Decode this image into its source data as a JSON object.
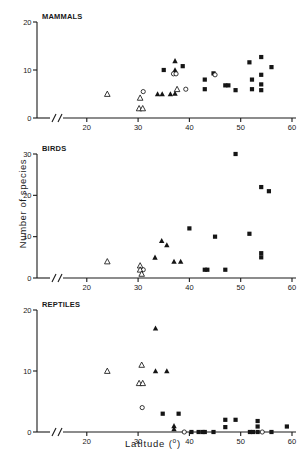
{
  "figure": {
    "xlabel_text": "Latitude (",
    "xlabel_unit": "o",
    "xlabel_close": ")",
    "ylabel": "Number of species"
  },
  "chart_data": [
    {
      "type": "scatter",
      "title": "MAMMALS",
      "xlabel": "Latitude (º)",
      "ylabel": "Number of species",
      "xlim": [
        14,
        60
      ],
      "ylim": [
        0,
        20
      ],
      "xticks": [
        20,
        30,
        40,
        50,
        60
      ],
      "yticks": [
        0,
        10,
        20
      ],
      "axis_break_x": true,
      "grid": false,
      "legend": "none",
      "series": [
        {
          "name": "filled-square",
          "marker": "filled-square",
          "points": [
            [
              35,
              10
            ],
            [
              38.7,
              10.8
            ],
            [
              43,
              8
            ],
            [
              43,
              6
            ],
            [
              44.7,
              9.3
            ],
            [
              47,
              6.8
            ],
            [
              47.6,
              6.8
            ],
            [
              49,
              5.8
            ],
            [
              51.7,
              11.6
            ],
            [
              52.2,
              8
            ],
            [
              52.2,
              6
            ],
            [
              54,
              12.7
            ],
            [
              54,
              9
            ],
            [
              54,
              7
            ],
            [
              54,
              5.8
            ],
            [
              56,
              10.6
            ]
          ]
        },
        {
          "name": "filled-triangle",
          "marker": "filled-triangle",
          "points": [
            [
              33.8,
              5
            ],
            [
              34.7,
              5
            ],
            [
              36.3,
              5
            ],
            [
              37.2,
              11.9
            ],
            [
              37.2,
              10
            ],
            [
              37.2,
              5.1
            ]
          ]
        },
        {
          "name": "open-circle",
          "marker": "open-circle",
          "points": [
            [
              31,
              5.5
            ],
            [
              36.9,
              9.2
            ],
            [
              37.4,
              9.2
            ],
            [
              39.3,
              6
            ],
            [
              45,
              9
            ]
          ]
        },
        {
          "name": "open-triangle",
          "marker": "open-triangle",
          "points": [
            [
              24,
              5
            ],
            [
              30.4,
              4.2
            ],
            [
              30.2,
              2
            ],
            [
              30.9,
              2
            ],
            [
              37.6,
              6
            ]
          ]
        }
      ]
    },
    {
      "type": "scatter",
      "title": "BIRDS",
      "xlabel": "Latitude (º)",
      "ylabel": "Number of species",
      "xlim": [
        14,
        60
      ],
      "ylim": [
        0,
        30
      ],
      "xticks": [
        20,
        30,
        40,
        50,
        60
      ],
      "yticks": [
        0,
        10,
        20,
        30
      ],
      "axis_break_x": true,
      "grid": false,
      "legend": "none",
      "series": [
        {
          "name": "filled-square",
          "marker": "filled-square",
          "points": [
            [
              40,
              12
            ],
            [
              43,
              2
            ],
            [
              43.5,
              2
            ],
            [
              47,
              2
            ],
            [
              49,
              30
            ],
            [
              51.7,
              10.7
            ],
            [
              54,
              22
            ],
            [
              54,
              6
            ],
            [
              54,
              5
            ],
            [
              55.5,
              21
            ],
            [
              45,
              10
            ]
          ]
        },
        {
          "name": "filled-triangle",
          "marker": "filled-triangle",
          "points": [
            [
              33.3,
              5
            ],
            [
              34.6,
              9
            ],
            [
              35.6,
              8
            ],
            [
              37,
              4
            ],
            [
              38.3,
              4
            ]
          ]
        },
        {
          "name": "open-circle",
          "marker": "open-circle",
          "points": [
            [
              31,
              2
            ]
          ]
        },
        {
          "name": "open-triangle",
          "marker": "open-triangle",
          "points": [
            [
              24,
              4
            ],
            [
              30.4,
              3
            ],
            [
              30.4,
              2
            ],
            [
              30.7,
              1
            ]
          ]
        }
      ]
    },
    {
      "type": "scatter",
      "title": "REPTILES",
      "xlabel": "Latitude (º)",
      "ylabel": "Number of species",
      "xlim": [
        14,
        60
      ],
      "ylim": [
        0,
        20
      ],
      "xticks": [
        20,
        30,
        40,
        50,
        60
      ],
      "yticks": [
        0,
        10,
        20
      ],
      "axis_break_x": true,
      "grid": false,
      "legend": "none",
      "series": [
        {
          "name": "filled-square",
          "marker": "filled-square",
          "points": [
            [
              34.8,
              3
            ],
            [
              37.9,
              3
            ],
            [
              40.4,
              0
            ],
            [
              41.8,
              0
            ],
            [
              42.6,
              0
            ],
            [
              43,
              0
            ],
            [
              44.7,
              0
            ],
            [
              47,
              2
            ],
            [
              47,
              0.8
            ],
            [
              49,
              2
            ],
            [
              51.8,
              0
            ],
            [
              52.4,
              0
            ],
            [
              53.3,
              1.8
            ],
            [
              53.3,
              0.9
            ],
            [
              53.3,
              0
            ],
            [
              56,
              0
            ],
            [
              59,
              0.9
            ]
          ]
        },
        {
          "name": "filled-triangle",
          "marker": "filled-triangle",
          "points": [
            [
              33.4,
              17
            ],
            [
              33.4,
              10
            ],
            [
              35.6,
              10
            ],
            [
              37,
              1
            ],
            [
              37,
              0.5
            ]
          ]
        },
        {
          "name": "open-circle",
          "marker": "open-circle",
          "points": [
            [
              30.8,
              4
            ],
            [
              39,
              0
            ],
            [
              54.2,
              0
            ]
          ]
        },
        {
          "name": "open-triangle",
          "marker": "open-triangle",
          "points": [
            [
              24,
              10
            ],
            [
              30.7,
              11
            ],
            [
              30.2,
              8
            ],
            [
              30.9,
              8
            ]
          ]
        }
      ]
    }
  ]
}
